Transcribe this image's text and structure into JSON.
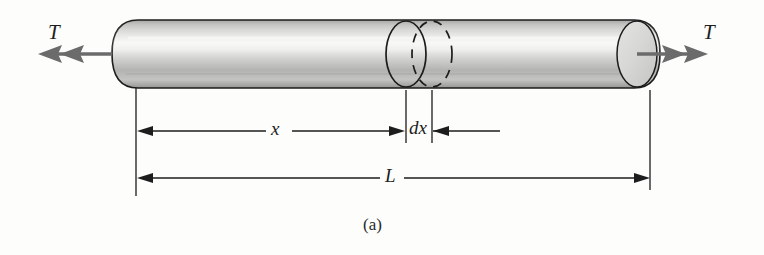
{
  "figure": {
    "caption": "(a)",
    "background_color": "#fdfdfc",
    "line_color": "#1d1d1d",
    "arrow_color": "#6b6b6b"
  },
  "labels": {
    "torque_left": "T",
    "torque_right": "T",
    "length_partial": "x",
    "differential_element": "dx",
    "length_total": "L"
  },
  "shaft": {
    "fill_light": "#f2f2f0",
    "fill_mid": "#c8c8c6",
    "fill_dark": "#9a9a98",
    "outline_color": "#1d1d1d",
    "left_x": 112,
    "right_x": 660,
    "top_y": 20,
    "bottom_y": 88
  },
  "cross_sections": [
    {
      "name": "section-solid",
      "style": "solid",
      "center_x": 406
    },
    {
      "name": "section-dashed",
      "style": "dashed",
      "center_x": 432
    }
  ],
  "dimensions": [
    {
      "name": "x",
      "label": "x",
      "from_x": 136,
      "to_x": 406,
      "line_y": 131
    },
    {
      "name": "dx",
      "label": "dx",
      "from_x": 406,
      "to_x": 432,
      "line_y": 131
    },
    {
      "name": "L",
      "label": "L",
      "from_x": 136,
      "to_x": 650,
      "line_y": 178
    }
  ],
  "torque_arrows": [
    {
      "name": "torque-arrow-left",
      "direction": "left",
      "double_headed": true
    },
    {
      "name": "torque-arrow-right",
      "direction": "right",
      "double_headed": true
    }
  ]
}
